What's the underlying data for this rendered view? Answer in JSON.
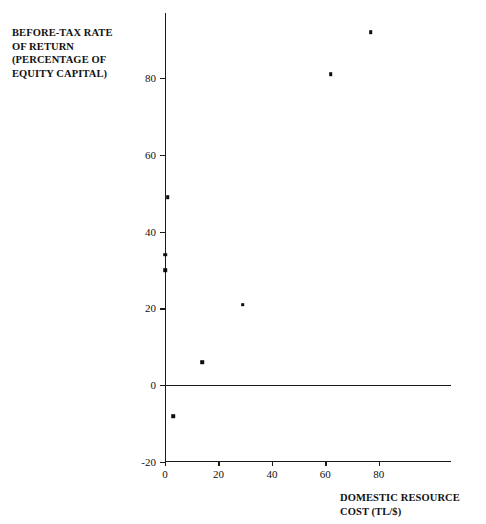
{
  "chart_data": {
    "type": "scatter",
    "title": "",
    "ylabel": "BEFORE-TAX RATE\nOF RETURN\n(PERCENTAGE OF\nEQUITY CAPITAL)",
    "xlabel": "DOMESTIC RESOURCE\nCOST (TL/$)",
    "xlim": [
      0,
      107
    ],
    "ylim": [
      -20,
      97
    ],
    "grid": false,
    "legend": null,
    "xticks": [
      0,
      20,
      40,
      60,
      80
    ],
    "yticks": [
      -20,
      0,
      20,
      40,
      60,
      80
    ],
    "xtick_labels": [
      "0",
      "20",
      "40",
      "60",
      "80"
    ],
    "ytick_labels": [
      "-20",
      "0",
      "20",
      "40",
      "60",
      "80"
    ],
    "zero_line": 0,
    "marker": "square",
    "marker_color": "#0d0d0d",
    "x": [
      1,
      0,
      0,
      3,
      14,
      29,
      62,
      77
    ],
    "y": [
      49,
      34,
      30,
      -8,
      6,
      21,
      81,
      92
    ],
    "points": [
      {
        "x": 1,
        "y": 49
      },
      {
        "x": 0,
        "y": 34
      },
      {
        "x": 0,
        "y": 30
      },
      {
        "x": 3,
        "y": -8
      },
      {
        "x": 14,
        "y": 6
      },
      {
        "x": 29,
        "y": 21
      },
      {
        "x": 62,
        "y": 81
      },
      {
        "x": 77,
        "y": 92
      }
    ]
  },
  "axis": {
    "y_title": "BEFORE-TAX RATE\nOF RETURN\n(PERCENTAGE OF\nEQUITY CAPITAL)",
    "x_title": "DOMESTIC RESOURCE\nCOST (TL/$)"
  }
}
